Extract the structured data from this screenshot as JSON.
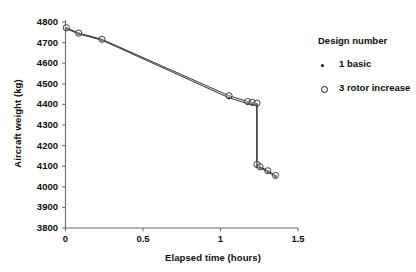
{
  "chart_data": {
    "type": "line",
    "title": "",
    "xlabel": "Elapsed time (hours)",
    "ylabel": "Aircraft weight (kg)",
    "xlim": [
      0,
      1.5
    ],
    "ylim": [
      3800,
      4800
    ],
    "xticks": [
      "0",
      "0.5",
      "1",
      "1.5"
    ],
    "xtick_values": [
      0,
      0.5,
      1,
      1.5
    ],
    "yticks": [
      "3800",
      "3900",
      "4000",
      "4100",
      "4200",
      "4300",
      "4400",
      "4500",
      "4600",
      "4700",
      "4800"
    ],
    "ytick_values": [
      3800,
      3900,
      4000,
      4100,
      4200,
      4300,
      4400,
      4500,
      4600,
      4700,
      4800
    ],
    "grid": false,
    "legend_position": "right",
    "legend_title": "Design number",
    "series": [
      {
        "name": "1 basic",
        "marker": "small-dot",
        "x": [
          0.005,
          0.085,
          0.235,
          1.055,
          1.175,
          1.205,
          1.235,
          1.235,
          1.255,
          1.305,
          1.355
        ],
        "y": [
          4768,
          4742,
          4712,
          4432,
          4404,
          4400,
          4397,
          4103,
          4092,
          4073,
          4050
        ]
      },
      {
        "name": "3 rotor increase",
        "marker": "open-circle",
        "x": [
          0.005,
          0.085,
          0.235,
          1.055,
          1.175,
          1.205,
          1.235,
          1.235,
          1.255,
          1.305,
          1.355
        ],
        "y": [
          4772,
          4746,
          4716,
          4442,
          4414,
          4410,
          4406,
          4108,
          4097,
          4078,
          4055
        ]
      }
    ]
  },
  "legend": {
    "title": "Design number",
    "entries": [
      {
        "label": "1 basic",
        "marker": "dot-marker"
      },
      {
        "label": "3 rotor increase",
        "marker": "circle-marker"
      }
    ]
  }
}
